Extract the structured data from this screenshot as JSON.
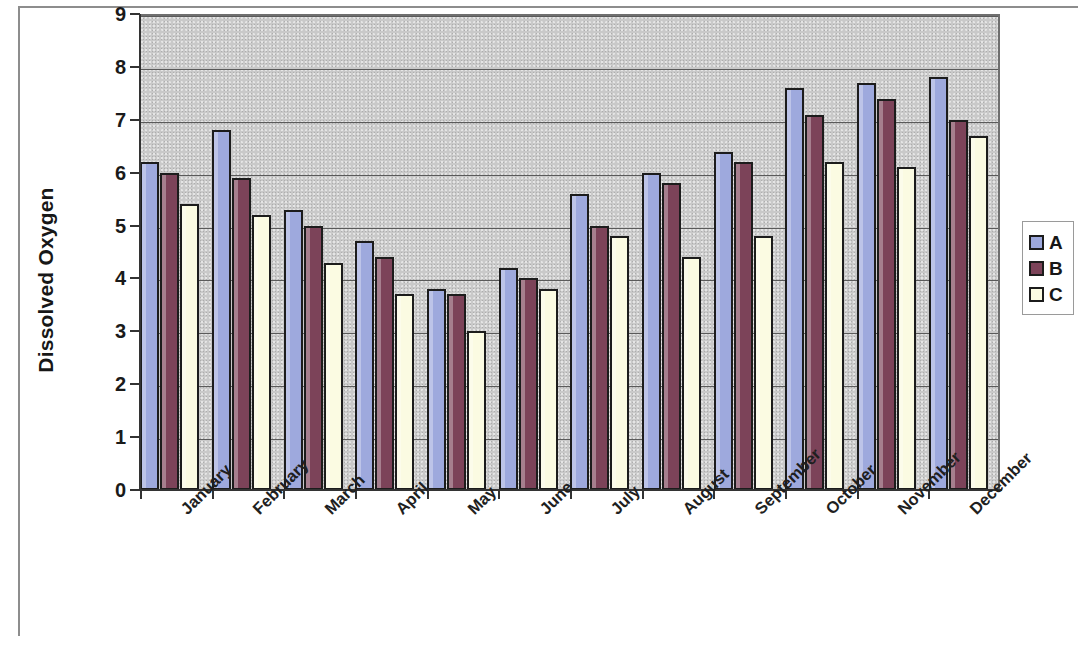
{
  "chart_data": {
    "type": "bar",
    "title": "",
    "xlabel": "",
    "ylabel": "Dissolved Oxygen",
    "ylim": [
      0,
      9
    ],
    "ytick_labels": [
      "0",
      "1",
      "2",
      "3",
      "4",
      "5",
      "6",
      "7",
      "8",
      "9"
    ],
    "grid": true,
    "legend_position": "right",
    "categories": [
      "January",
      "February",
      "March",
      "April",
      "May",
      "June",
      "July",
      "August",
      "September",
      "October",
      "November",
      "December"
    ],
    "series": [
      {
        "name": "A",
        "color": "#9ea9dd",
        "values": [
          6.2,
          6.8,
          5.3,
          4.7,
          3.8,
          4.2,
          5.6,
          6.0,
          6.4,
          7.6,
          7.7,
          7.8
        ]
      },
      {
        "name": "B",
        "color": "#7c4359",
        "values": [
          6.0,
          5.9,
          5.0,
          4.4,
          3.7,
          4.0,
          5.0,
          5.8,
          6.2,
          7.1,
          7.4,
          7.0
        ]
      },
      {
        "name": "C",
        "color": "#fbfbe2",
        "values": [
          5.4,
          5.2,
          4.3,
          3.7,
          3.0,
          3.8,
          4.8,
          4.4,
          4.8,
          6.2,
          6.1,
          6.7
        ]
      }
    ]
  },
  "legend": {
    "items": [
      {
        "label": "A",
        "color": "#9ea9dd"
      },
      {
        "label": "B",
        "color": "#7c4359"
      },
      {
        "label": "C",
        "color": "#fbfbe2"
      }
    ]
  },
  "axes": {
    "y_title": "Dissolved Oxygen"
  }
}
